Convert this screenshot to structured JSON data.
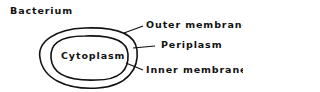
{
  "diagram": {
    "title": "Bacterium",
    "center_label": "Cytoplasm",
    "callouts": [
      {
        "label": "Outer membrane"
      },
      {
        "label": "Periplasm"
      },
      {
        "label": "Inner membrane"
      }
    ]
  }
}
